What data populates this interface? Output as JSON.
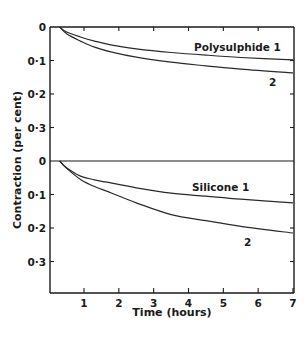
{
  "chart_data": {
    "type": "line",
    "xlabel": "Time (hours)",
    "ylabel": "Contraction (per cent)",
    "x_ticks": [
      "1",
      "2",
      "3",
      "4",
      "5",
      "6",
      "7"
    ],
    "xlim": [
      0,
      7
    ],
    "y_ticks": [
      "0",
      "0·1",
      "0·2",
      "0·3"
    ],
    "y_inverted": true,
    "grid": false,
    "panels": [
      {
        "name": "Polysulphide",
        "ylim": [
          0,
          0.4
        ],
        "series": [
          {
            "name": "Polysulphide 1",
            "label": "Polysulphide 1",
            "x": [
              0.3,
              0.5,
              0.9,
              1.3,
              1.8,
              2.5,
              3.5,
              4.5,
              5.5,
              7.0
            ],
            "y": [
              0.0,
              0.015,
              0.03,
              0.042,
              0.054,
              0.065,
              0.076,
              0.084,
              0.091,
              0.098
            ]
          },
          {
            "name": "Polysulphide 2",
            "label": "2",
            "x": [
              0.3,
              0.5,
              0.9,
              1.3,
              1.8,
              2.5,
              3.5,
              4.5,
              5.5,
              7.0
            ],
            "y": [
              0.0,
              0.02,
              0.042,
              0.06,
              0.075,
              0.09,
              0.105,
              0.116,
              0.126,
              0.137
            ]
          }
        ]
      },
      {
        "name": "Silicone",
        "ylim": [
          0,
          0.4
        ],
        "series": [
          {
            "name": "Silicone 1",
            "label": "Silicone 1",
            "x": [
              0.3,
              0.5,
              0.9,
              1.3,
              1.8,
              2.5,
              3.5,
              4.5,
              5.5,
              7.0
            ],
            "y": [
              0.0,
              0.02,
              0.045,
              0.056,
              0.066,
              0.08,
              0.096,
              0.105,
              0.114,
              0.125
            ]
          },
          {
            "name": "Silicone 2",
            "label": "2",
            "x": [
              0.3,
              0.5,
              0.9,
              1.3,
              1.8,
              2.5,
              3.5,
              4.5,
              5.5,
              7.0
            ],
            "y": [
              0.0,
              0.022,
              0.055,
              0.076,
              0.096,
              0.125,
              0.16,
              0.178,
              0.195,
              0.215
            ]
          }
        ]
      }
    ]
  },
  "labels": {
    "ylabel": "Contraction (per cent)",
    "xlabel": "Time (hours)",
    "poly1": "Polysulphide 1",
    "poly2": "2",
    "sil1": "Silicone 1",
    "sil2": "2"
  }
}
